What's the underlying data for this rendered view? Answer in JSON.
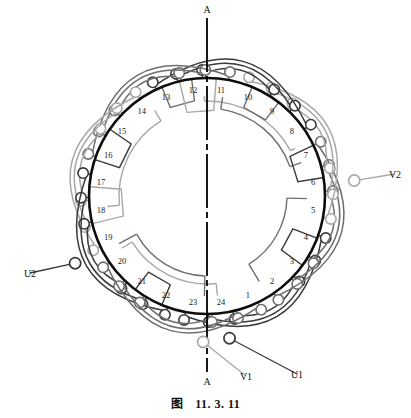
{
  "figure": {
    "caption_prefix": "图",
    "caption_number": "11. 3. 11",
    "type": "stator-winding-diagram",
    "slot_count": 24,
    "poles": 4,
    "phases": 3
  },
  "axis": {
    "label_top": "A",
    "label_bottom": "A",
    "style": "dash-dot vertical centerline"
  },
  "colors": {
    "core_ring": "#0d0d0d",
    "phase_u": "#3a3a3a",
    "phase_v": "#a8a8a8",
    "phase_w": "#6e6e6e",
    "slot_number": "#1a1a1a",
    "background": "#ffffff"
  },
  "slots": [
    {
      "n": "1"
    },
    {
      "n": "2"
    },
    {
      "n": "3"
    },
    {
      "n": "4"
    },
    {
      "n": "5"
    },
    {
      "n": "6"
    },
    {
      "n": "7"
    },
    {
      "n": "8"
    },
    {
      "n": "9"
    },
    {
      "n": "10"
    },
    {
      "n": "11"
    },
    {
      "n": "12"
    },
    {
      "n": "13"
    },
    {
      "n": "14"
    },
    {
      "n": "15"
    },
    {
      "n": "16"
    },
    {
      "n": "17"
    },
    {
      "n": "18"
    },
    {
      "n": "19"
    },
    {
      "n": "20"
    },
    {
      "n": "21"
    },
    {
      "n": "22"
    },
    {
      "n": "23"
    },
    {
      "n": "24"
    }
  ],
  "terminals": [
    {
      "id": "U1",
      "label": "U1",
      "phase": "u",
      "position": "bottom-right"
    },
    {
      "id": "U2",
      "label": "U2",
      "phase": "u",
      "position": "left"
    },
    {
      "id": "V1",
      "label": "V1",
      "phase": "v",
      "position": "bottom-center"
    },
    {
      "id": "V2",
      "label": "V2",
      "phase": "v",
      "position": "right"
    }
  ],
  "chart_data": {
    "type": "diagram",
    "slot_numbers": [
      1,
      2,
      3,
      4,
      5,
      6,
      7,
      8,
      9,
      10,
      11,
      12,
      13,
      14,
      15,
      16,
      17,
      18,
      19,
      20,
      21,
      22,
      23,
      24
    ],
    "terminal_labels": [
      "U1",
      "U2",
      "V1",
      "V2"
    ],
    "axis_labels": [
      "A",
      "A"
    ]
  }
}
